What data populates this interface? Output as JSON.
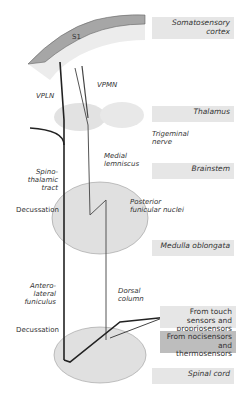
{
  "regions": {
    "cortex": "Somatosensory cortex",
    "thalamus": "Thalamus",
    "brainstem": "Brainstem",
    "medulla": "Medulla oblongata",
    "spinal": "Spinal cord"
  },
  "sources": {
    "touch": "From touch sensors and propriosensors",
    "noci": "From nocisensors and thermosensors"
  },
  "labels": {
    "s1": "S1",
    "vpln": "VPLN",
    "vpmn": "VPMN",
    "trigeminal": "Trigeminal nerve",
    "medial_lemniscus": "Medial lemniscus",
    "spinothalamic": "Spino-thalamic tract",
    "decussation_upper": "Decussation",
    "posterior_funicular": "Posterior funicular nuclei",
    "anterolateral": "Antero-lateral funiculus",
    "dorsal_column": "Dorsal column",
    "decussation_lower": "Decussation"
  },
  "colors": {
    "label_bg": "#e6e6e6",
    "label_dark_bg": "#bdbdbd",
    "cortex_fill": "#a6a6a6",
    "tract": "#222222"
  }
}
